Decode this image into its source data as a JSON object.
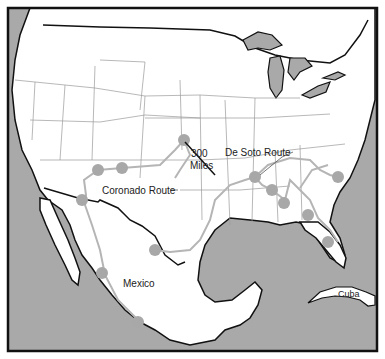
{
  "map": {
    "title": "Spanish Explorer Routes",
    "colors": {
      "water": "#a9a9a9",
      "land": "#ffffff",
      "coast": "#111111",
      "state_border": "#888888",
      "route": "#b0b0b0",
      "stop": "#a8a8a8"
    },
    "labels": {
      "scale_value": "300",
      "scale_unit": "Miles",
      "de_soto": "De Soto Route",
      "coronado": "Coronado Route",
      "mexico": "Mexico",
      "cuba": "Cuba"
    },
    "routes": [
      {
        "name": "Coronado Route",
        "stops": [
          [
            140,
            288
          ],
          [
            102,
            272
          ],
          [
            82,
            200
          ],
          [
            98,
            170
          ],
          [
            122,
            168
          ],
          [
            184,
            140
          ]
        ]
      },
      {
        "name": "De Soto Route",
        "stops": [
          [
            155,
            250
          ],
          [
            255,
            177
          ],
          [
            272,
            190
          ],
          [
            284,
            203
          ],
          [
            308,
            215
          ],
          [
            328,
            242
          ],
          [
            338,
            177
          ]
        ]
      }
    ]
  }
}
